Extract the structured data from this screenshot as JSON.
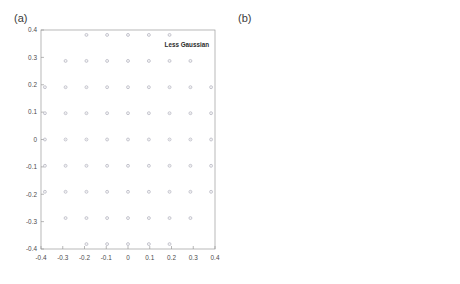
{
  "figure": {
    "background_color": "#ffffff",
    "axis_color": "#9a9a9a",
    "tick_label_color": "#4a4a4a",
    "marker_color": "#cfcfd6",
    "marker_edge_color": "#b9b9c4",
    "annotation_color": "#2b2b2b"
  },
  "panels": [
    {
      "id": "a",
      "label": "(a)",
      "annotation": "Less Gaussian",
      "lattice": "square",
      "spacing": 0.0955
    },
    {
      "id": "b",
      "label": "(b)",
      "annotation": "More Gaussian",
      "lattice": "hexagonal",
      "spacing": 0.0675
    }
  ],
  "chart_data": [
    {
      "type": "scatter",
      "panel": "a",
      "title": "",
      "annotation": "Less Gaussian",
      "xlabel": "",
      "ylabel": "",
      "xlim": [
        -0.4,
        0.4
      ],
      "ylim": [
        -0.4,
        0.4
      ],
      "xticks": [
        -0.4,
        -0.3,
        -0.2,
        -0.1,
        0,
        0.1,
        0.2,
        0.3,
        0.4
      ],
      "xticklabels": [
        "-0.4",
        "-0.3",
        "-0.2",
        "-0.1",
        "0",
        "0.1",
        "0.2",
        "0.3",
        "0.4"
      ],
      "yticks": [
        -0.4,
        -0.3,
        -0.2,
        -0.1,
        0,
        0.1,
        0.2,
        0.3,
        0.4
      ],
      "yticklabels": [
        "-0.4",
        "-0.3",
        "-0.2",
        "-0.1",
        "0",
        "0.1",
        "0.2",
        "0.3",
        "0.4"
      ],
      "grid": false,
      "legend": false,
      "marker": "dot",
      "points": [
        [
          -0.191,
          0.382
        ],
        [
          -0.096,
          0.382
        ],
        [
          0.0,
          0.382
        ],
        [
          0.096,
          0.382
        ],
        [
          0.191,
          0.382
        ],
        [
          -0.287,
          0.287
        ],
        [
          -0.191,
          0.287
        ],
        [
          -0.096,
          0.287
        ],
        [
          0.0,
          0.287
        ],
        [
          0.096,
          0.287
        ],
        [
          0.191,
          0.287
        ],
        [
          0.287,
          0.287
        ],
        [
          -0.382,
          0.191
        ],
        [
          -0.287,
          0.191
        ],
        [
          -0.191,
          0.191
        ],
        [
          -0.096,
          0.191
        ],
        [
          0.0,
          0.191
        ],
        [
          0.096,
          0.191
        ],
        [
          0.191,
          0.191
        ],
        [
          0.287,
          0.191
        ],
        [
          0.382,
          0.191
        ],
        [
          -0.382,
          0.096
        ],
        [
          -0.287,
          0.096
        ],
        [
          -0.191,
          0.096
        ],
        [
          -0.096,
          0.096
        ],
        [
          0.0,
          0.096
        ],
        [
          0.096,
          0.096
        ],
        [
          0.191,
          0.096
        ],
        [
          0.287,
          0.096
        ],
        [
          0.382,
          0.096
        ],
        [
          -0.382,
          0.0
        ],
        [
          -0.287,
          0.0
        ],
        [
          -0.191,
          0.0
        ],
        [
          -0.096,
          0.0
        ],
        [
          0.0,
          0.0
        ],
        [
          0.096,
          0.0
        ],
        [
          0.191,
          0.0
        ],
        [
          0.287,
          0.0
        ],
        [
          0.382,
          0.0
        ],
        [
          -0.382,
          -0.096
        ],
        [
          -0.287,
          -0.096
        ],
        [
          -0.191,
          -0.096
        ],
        [
          -0.096,
          -0.096
        ],
        [
          0.0,
          -0.096
        ],
        [
          0.096,
          -0.096
        ],
        [
          0.191,
          -0.096
        ],
        [
          0.287,
          -0.096
        ],
        [
          0.382,
          -0.096
        ],
        [
          -0.382,
          -0.191
        ],
        [
          -0.287,
          -0.191
        ],
        [
          -0.191,
          -0.191
        ],
        [
          -0.096,
          -0.191
        ],
        [
          0.0,
          -0.191
        ],
        [
          0.096,
          -0.191
        ],
        [
          0.191,
          -0.191
        ],
        [
          0.287,
          -0.191
        ],
        [
          0.382,
          -0.191
        ],
        [
          -0.287,
          -0.287
        ],
        [
          -0.191,
          -0.287
        ],
        [
          -0.096,
          -0.287
        ],
        [
          0.0,
          -0.287
        ],
        [
          0.096,
          -0.287
        ],
        [
          0.191,
          -0.287
        ],
        [
          0.287,
          -0.287
        ],
        [
          -0.191,
          -0.382
        ],
        [
          -0.096,
          -0.382
        ],
        [
          0.0,
          -0.382
        ],
        [
          0.096,
          -0.382
        ],
        [
          0.191,
          -0.382
        ]
      ]
    },
    {
      "type": "scatter",
      "panel": "b",
      "title": "",
      "annotation": "More Gaussian",
      "xlabel": "",
      "ylabel": "",
      "xlim": [
        -0.5,
        0.5
      ],
      "ylim": [
        -0.5,
        0.5
      ],
      "xticks": [
        -0.5,
        0,
        0.5
      ],
      "xticklabels": [
        "-0.5",
        "0",
        "0.5"
      ],
      "yticks": [
        -0.5,
        -0.4,
        -0.3,
        -0.2,
        -0.1,
        0,
        0.1,
        0.2,
        0.3,
        0.4,
        0.5
      ],
      "yticklabels": [
        "-0.5",
        "-0.4",
        "-0.3",
        "-0.2",
        "-0.1",
        "0",
        "0.1",
        "0.2",
        "0.3",
        "0.4",
        "0.5"
      ],
      "grid": false,
      "legend": false,
      "marker": "dot",
      "points": [
        [
          -0.135,
          0.404
        ],
        [
          0.0,
          0.404
        ],
        [
          0.135,
          0.404
        ],
        [
          -0.202,
          0.337
        ],
        [
          -0.067,
          0.337
        ],
        [
          0.067,
          0.337
        ],
        [
          0.202,
          0.337
        ],
        [
          -0.27,
          0.27
        ],
        [
          -0.135,
          0.27
        ],
        [
          0.0,
          0.27
        ],
        [
          0.135,
          0.27
        ],
        [
          0.27,
          0.27
        ],
        [
          -0.337,
          0.202
        ],
        [
          -0.202,
          0.202
        ],
        [
          -0.067,
          0.202
        ],
        [
          0.067,
          0.202
        ],
        [
          0.202,
          0.202
        ],
        [
          0.337,
          0.202
        ],
        [
          -0.404,
          0.135
        ],
        [
          -0.27,
          0.135
        ],
        [
          -0.135,
          0.135
        ],
        [
          0.0,
          0.135
        ],
        [
          0.135,
          0.135
        ],
        [
          0.27,
          0.135
        ],
        [
          0.404,
          0.135
        ],
        [
          -0.337,
          0.067
        ],
        [
          -0.202,
          0.067
        ],
        [
          -0.067,
          0.067
        ],
        [
          0.067,
          0.067
        ],
        [
          0.202,
          0.067
        ],
        [
          0.337,
          0.067
        ],
        [
          -0.404,
          0.0
        ],
        [
          -0.27,
          0.0
        ],
        [
          -0.135,
          0.0
        ],
        [
          0.0,
          0.0
        ],
        [
          0.135,
          0.0
        ],
        [
          0.27,
          0.0
        ],
        [
          0.404,
          0.0
        ],
        [
          -0.337,
          -0.067
        ],
        [
          -0.202,
          -0.067
        ],
        [
          -0.067,
          -0.067
        ],
        [
          0.067,
          -0.067
        ],
        [
          0.202,
          -0.067
        ],
        [
          0.337,
          -0.067
        ],
        [
          -0.404,
          -0.135
        ],
        [
          -0.27,
          -0.135
        ],
        [
          -0.135,
          -0.135
        ],
        [
          0.0,
          -0.135
        ],
        [
          0.135,
          -0.135
        ],
        [
          0.27,
          -0.135
        ],
        [
          0.404,
          -0.135
        ],
        [
          -0.337,
          -0.202
        ],
        [
          -0.202,
          -0.202
        ],
        [
          -0.067,
          -0.202
        ],
        [
          0.067,
          -0.202
        ],
        [
          0.202,
          -0.202
        ],
        [
          0.337,
          -0.202
        ],
        [
          -0.27,
          -0.27
        ],
        [
          -0.135,
          -0.27
        ],
        [
          0.0,
          -0.27
        ],
        [
          0.135,
          -0.27
        ],
        [
          0.27,
          -0.27
        ],
        [
          -0.202,
          -0.337
        ],
        [
          -0.067,
          -0.337
        ],
        [
          0.067,
          -0.337
        ],
        [
          0.202,
          -0.337
        ],
        [
          -0.135,
          -0.404
        ],
        [
          0.0,
          -0.404
        ],
        [
          0.135,
          -0.404
        ]
      ]
    }
  ]
}
